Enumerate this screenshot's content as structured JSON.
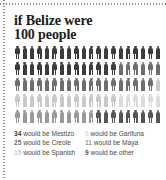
{
  "title": {
    "line1": "if Belize were",
    "line2": "100 people"
  },
  "chart_data": {
    "type": "pictogram",
    "title": "if Belize were 100 people",
    "unit_label": "person",
    "total": 100,
    "rows": 5,
    "columns": 20,
    "categories": [
      "Mestizo",
      "Creole",
      "Spanish",
      "Garifuna",
      "Maya",
      "other"
    ],
    "values": [
      34,
      25,
      15,
      6,
      11,
      9
    ],
    "colors": [
      "#3b3b3b",
      "#6e6e6e",
      "#c9c9c9",
      "#dcdcdc",
      "#9a9a9a",
      "#555555"
    ],
    "sequence_order": [
      "Mestizo",
      "Creole",
      "Spanish",
      "Garifuna",
      "Maya",
      "other"
    ],
    "legend_position": "bottom",
    "grid": false
  },
  "legend": {
    "left": [
      {
        "num": "34",
        "text": "would be Mestizo",
        "color": "#3b3b3b"
      },
      {
        "num": "25",
        "text": "would be Creole",
        "color": "#6e6e6e"
      },
      {
        "num": "15",
        "text": "would be Spanish",
        "color": "#c9c9c9"
      }
    ],
    "right": [
      {
        "num": "6",
        "text": "would be Garifuna",
        "color": "#dcdcdc"
      },
      {
        "num": "11",
        "text": "would be Maya",
        "color": "#9a9a9a"
      },
      {
        "num": "9",
        "text": "would be other",
        "color": "#555555"
      }
    ]
  }
}
